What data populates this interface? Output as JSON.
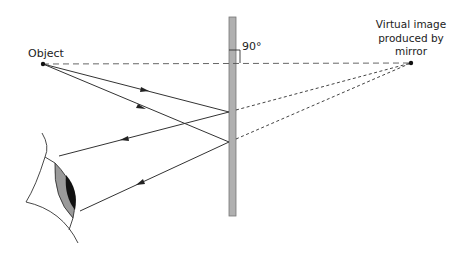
{
  "diagram": {
    "type": "plane-mirror-reflection",
    "labels": {
      "object": "Object",
      "angle": "90°",
      "virtual_image_line1": "Virtual image",
      "virtual_image_line2": "produced by",
      "virtual_image_line3": "mirror"
    },
    "colors": {
      "line": "#333333",
      "mirror_fill": "#b0b0b0",
      "mirror_stroke": "#777777",
      "iris": "#9a9a9a",
      "pupil": "#111111",
      "dashed": "#555555"
    },
    "points": {
      "object": [
        43,
        64
      ],
      "virtual_image": [
        411,
        63
      ],
      "reflection_upper": [
        229,
        112
      ],
      "reflection_lower": [
        229,
        142
      ]
    }
  }
}
